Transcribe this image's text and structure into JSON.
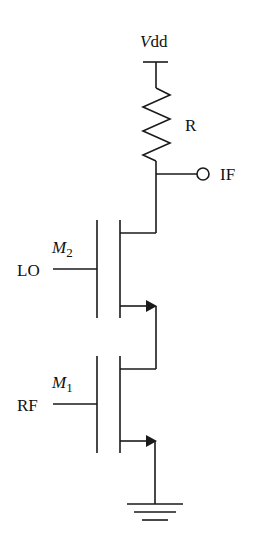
{
  "diagram": {
    "type": "circuit-schematic",
    "labels": {
      "supply": "Vdd",
      "supply_italic": "V",
      "supply_rest": "dd",
      "resistor": "R",
      "output": "IF",
      "lo_input": "LO",
      "rf_input": "RF",
      "m2_letter": "M",
      "m2_sub": "2",
      "m1_letter": "M",
      "m1_sub": "1"
    },
    "components": [
      {
        "id": "Vdd",
        "kind": "supply"
      },
      {
        "id": "R",
        "kind": "resistor",
        "between": [
          "Vdd",
          "IF"
        ]
      },
      {
        "id": "IF",
        "kind": "output-terminal"
      },
      {
        "id": "M2",
        "kind": "nmos",
        "gate": "LO",
        "drain": "IF",
        "source": "M1.drain"
      },
      {
        "id": "M1",
        "kind": "nmos",
        "gate": "RF",
        "drain": "M2.source",
        "source": "GND"
      },
      {
        "id": "GND",
        "kind": "ground"
      }
    ],
    "colors": {
      "stroke": "#1a1a1a",
      "background": "#ffffff"
    }
  }
}
